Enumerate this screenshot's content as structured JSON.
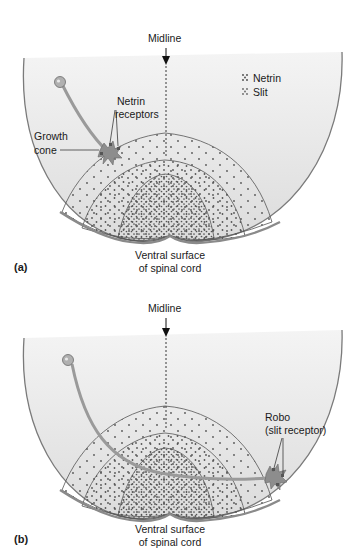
{
  "figure": {
    "panels": [
      {
        "id": "a",
        "panel_label": "(a)",
        "midline_label": "Midline",
        "ventral_label_line1": "Ventral surface",
        "ventral_label_line2": "of spinal cord",
        "growth_cone_label_line1": "Growth",
        "growth_cone_label_line2": "cone",
        "receptor_label_line1": "Netrin",
        "receptor_label_line2": "receptors",
        "legend": [
          {
            "symbol": "dot-cluster-icon",
            "label": "Netrin"
          },
          {
            "symbol": "dot-cluster-icon",
            "label": "Slit"
          }
        ]
      },
      {
        "id": "b",
        "panel_label": "(b)",
        "midline_label": "Midline",
        "ventral_label_line1": "Ventral surface",
        "ventral_label_line2": "of spinal cord",
        "receptor_label_line1": "Robo",
        "receptor_label_line2": "(slit receptor)"
      }
    ],
    "colors": {
      "background": "#ffffff",
      "cord_fill": "#e6e6e6",
      "cord_outline": "#7a7a7a",
      "neuron": "#9a9a9a",
      "dots": "#555555"
    }
  }
}
